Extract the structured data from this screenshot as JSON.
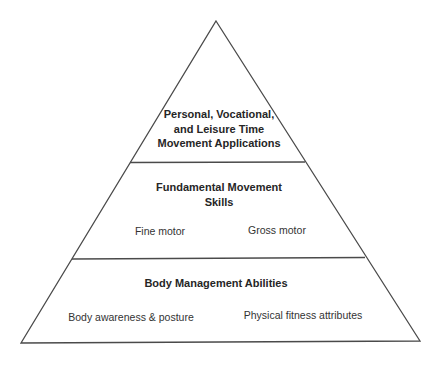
{
  "diagram": {
    "type": "pyramid",
    "colors": {
      "stroke": "#4a4a4a",
      "background": "#ffffff",
      "text": "#262626"
    },
    "tiers": [
      {
        "level": "top",
        "title_lines": [
          "Personal, Vocational,",
          "and Leisure Time",
          "Movement Applications"
        ],
        "items": []
      },
      {
        "level": "middle",
        "title_lines": [
          "Fundamental Movement",
          "Skills"
        ],
        "items": [
          "Fine motor",
          "Gross motor"
        ]
      },
      {
        "level": "base",
        "title_lines": [
          "Body Management Abilities"
        ],
        "items": [
          "Body awareness & posture",
          "Physical fitness attributes"
        ]
      }
    ]
  }
}
